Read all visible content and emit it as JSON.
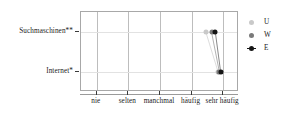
{
  "chart_data": {
    "type": "scatter",
    "title": "",
    "subtitle": "",
    "xlabel": "",
    "ylabel": "",
    "grid": true,
    "legend_position": "right",
    "categories": [
      "nie",
      "selten",
      "manchmal",
      "häufig",
      "sehr häufig"
    ],
    "x_tick_values": [
      1,
      2,
      3,
      4,
      5
    ],
    "xlim": [
      0.5,
      5.5
    ],
    "y_categories": [
      "Suchmaschinen**",
      "Internet*"
    ],
    "ylim": [
      0.5,
      2.5
    ],
    "series": [
      {
        "name": "U",
        "color": "#c9c9c9",
        "marker": "circle",
        "points": [
          {
            "y_category": "Suchmaschinen**",
            "value": 4.45
          },
          {
            "y_category": "Internet*",
            "value": 4.84
          }
        ]
      },
      {
        "name": "W",
        "color": "#7a7a7a",
        "marker": "circle",
        "points": [
          {
            "y_category": "Suchmaschinen**",
            "value": 4.63
          },
          {
            "y_category": "Internet*",
            "value": 4.88
          }
        ]
      },
      {
        "name": "E",
        "color": "#151515",
        "marker": "circle",
        "points": [
          {
            "y_category": "Suchmaschinen**",
            "value": 4.75
          },
          {
            "y_category": "Internet*",
            "value": 4.92
          }
        ]
      }
    ]
  },
  "axes": {
    "x_labels": [
      {
        "text": "nie",
        "value": 1
      },
      {
        "text": "selten",
        "value": 2
      },
      {
        "text": "manchmal",
        "value": 3
      },
      {
        "text": "häufig",
        "value": 4
      },
      {
        "text": "sehr häufig",
        "value": 5
      }
    ],
    "y_labels": [
      {
        "text": "Suchmaschinen**",
        "value": 2
      },
      {
        "text": "Internet*",
        "value": 1
      }
    ]
  },
  "legend": {
    "entries": [
      {
        "label": "U",
        "color": "#c9c9c9"
      },
      {
        "label": "W",
        "color": "#7a7a7a"
      },
      {
        "label": "E",
        "color": "#151515"
      }
    ]
  },
  "style": {
    "frame_color": "#a8a8a8",
    "vgrid_color": "#bdbdbd",
    "hgrid_color": "#e2e2e2",
    "connector_color": "#b4b4b4",
    "background": "#ffffff"
  }
}
